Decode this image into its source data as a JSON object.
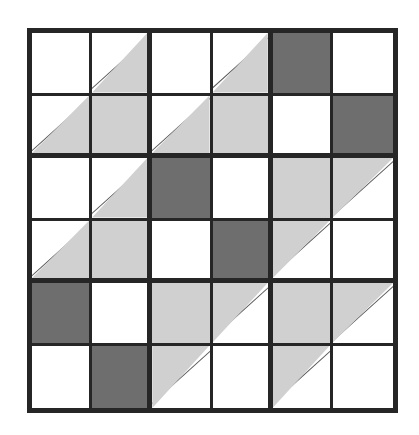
{
  "figure": {
    "rows": 6,
    "columns": 6,
    "fill_legend": {
      "blank": "unshaded white square",
      "solid-light": "fully light-gray square",
      "solid-dark": "fully dark-gray square",
      "tri-br-light": "light-gray triangle occupying the lower-right half",
      "tri-tl-light": "light-gray triangle occupying the upper-left half"
    },
    "colors": {
      "background": "#ffffff",
      "blank": "#ffffff",
      "light_gray": "#d0d0d0",
      "dark_gray": "#6e6e6e",
      "grid_line": "#262626",
      "diagonal_line": "#5a5a5a"
    }
  },
  "chart_data": {
    "type": "heatmap",
    "title": "",
    "xlabel": "",
    "ylabel": "",
    "grid": true,
    "legend": "none",
    "categories_x": [
      "1",
      "2",
      "3",
      "4",
      "5",
      "6"
    ],
    "categories_y": [
      "1",
      "2",
      "3",
      "4",
      "5",
      "6"
    ],
    "cells": [
      [
        {
          "row": 1,
          "col": 1,
          "fill": "blank",
          "value": 0
        },
        {
          "row": 1,
          "col": 2,
          "fill": "tri-br-light",
          "value": 0.5
        },
        {
          "row": 1,
          "col": 3,
          "fill": "blank",
          "value": 0
        },
        {
          "row": 1,
          "col": 4,
          "fill": "tri-br-light",
          "value": 0.5
        },
        {
          "row": 1,
          "col": 5,
          "fill": "solid-dark",
          "value": 2
        },
        {
          "row": 1,
          "col": 6,
          "fill": "blank",
          "value": 0
        }
      ],
      [
        {
          "row": 2,
          "col": 1,
          "fill": "tri-br-light",
          "value": 0.5
        },
        {
          "row": 2,
          "col": 2,
          "fill": "solid-light",
          "value": 1
        },
        {
          "row": 2,
          "col": 3,
          "fill": "tri-br-light",
          "value": 0.5
        },
        {
          "row": 2,
          "col": 4,
          "fill": "solid-light",
          "value": 1
        },
        {
          "row": 2,
          "col": 5,
          "fill": "blank",
          "value": 0
        },
        {
          "row": 2,
          "col": 6,
          "fill": "solid-dark",
          "value": 2
        }
      ],
      [
        {
          "row": 3,
          "col": 1,
          "fill": "blank",
          "value": 0
        },
        {
          "row": 3,
          "col": 2,
          "fill": "tri-br-light",
          "value": 0.5
        },
        {
          "row": 3,
          "col": 3,
          "fill": "solid-dark",
          "value": 2
        },
        {
          "row": 3,
          "col": 4,
          "fill": "blank",
          "value": 0
        },
        {
          "row": 3,
          "col": 5,
          "fill": "solid-light",
          "value": 1
        },
        {
          "row": 3,
          "col": 6,
          "fill": "tri-tl-light",
          "value": 0.5
        }
      ],
      [
        {
          "row": 4,
          "col": 1,
          "fill": "tri-br-light",
          "value": 0.5
        },
        {
          "row": 4,
          "col": 2,
          "fill": "solid-light",
          "value": 1
        },
        {
          "row": 4,
          "col": 3,
          "fill": "blank",
          "value": 0
        },
        {
          "row": 4,
          "col": 4,
          "fill": "solid-dark",
          "value": 2
        },
        {
          "row": 4,
          "col": 5,
          "fill": "tri-tl-light",
          "value": 0.5
        },
        {
          "row": 4,
          "col": 6,
          "fill": "blank",
          "value": 0
        }
      ],
      [
        {
          "row": 5,
          "col": 1,
          "fill": "solid-dark",
          "value": 2
        },
        {
          "row": 5,
          "col": 2,
          "fill": "blank",
          "value": 0
        },
        {
          "row": 5,
          "col": 3,
          "fill": "solid-light",
          "value": 1
        },
        {
          "row": 5,
          "col": 4,
          "fill": "tri-tl-light",
          "value": 0.5
        },
        {
          "row": 5,
          "col": 5,
          "fill": "solid-light",
          "value": 1
        },
        {
          "row": 5,
          "col": 6,
          "fill": "tri-tl-light",
          "value": 0.5
        }
      ],
      [
        {
          "row": 6,
          "col": 1,
          "fill": "blank",
          "value": 0
        },
        {
          "row": 6,
          "col": 2,
          "fill": "solid-dark",
          "value": 2
        },
        {
          "row": 6,
          "col": 3,
          "fill": "tri-tl-light",
          "value": 0.5
        },
        {
          "row": 6,
          "col": 4,
          "fill": "blank",
          "value": 0
        },
        {
          "row": 6,
          "col": 5,
          "fill": "tri-tl-light",
          "value": 0.5
        },
        {
          "row": 6,
          "col": 6,
          "fill": "blank",
          "value": 0
        }
      ]
    ]
  }
}
